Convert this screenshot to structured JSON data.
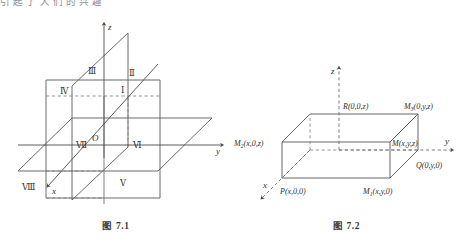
{
  "page": {
    "top_clipped_text": "引 起 了 人 们 的 兴 趣"
  },
  "figures": [
    {
      "id": "fig-7-1",
      "caption": "图 7.1",
      "axes": [
        {
          "name": "z-axis-label",
          "label": "z"
        },
        {
          "name": "y-axis-label",
          "label": "y"
        },
        {
          "name": "x-axis-label",
          "label": "x"
        }
      ],
      "origin_label": "O",
      "octants": [
        {
          "name": "octant-1",
          "label": "Ⅰ"
        },
        {
          "name": "octant-2",
          "label": "Ⅱ"
        },
        {
          "name": "octant-3",
          "label": "Ⅲ"
        },
        {
          "name": "octant-4",
          "label": "Ⅳ"
        },
        {
          "name": "octant-5",
          "label": "Ⅴ"
        },
        {
          "name": "octant-6",
          "label": "Ⅵ"
        },
        {
          "name": "octant-7",
          "label": "Ⅶ"
        },
        {
          "name": "octant-8",
          "label": "Ⅷ"
        }
      ]
    },
    {
      "id": "fig-7-2",
      "caption": "图 7.2",
      "axes": [
        {
          "name": "z-axis-label",
          "label": "z"
        },
        {
          "name": "y-axis-label",
          "label": "y"
        },
        {
          "name": "x-axis-label",
          "label": "x"
        }
      ],
      "points": [
        {
          "name": "point-R",
          "base": "R",
          "sub": "",
          "coords": "(0,0,z)"
        },
        {
          "name": "point-M3",
          "base": "M",
          "sub": "3",
          "coords": "(0,y,z)"
        },
        {
          "name": "point-M2",
          "base": "M",
          "sub": "2",
          "coords": "(x,0,z)"
        },
        {
          "name": "point-M",
          "base": "M",
          "sub": "",
          "coords": "(x,y,z)"
        },
        {
          "name": "point-Q",
          "base": "Q",
          "sub": "",
          "coords": "(0,y,0)"
        },
        {
          "name": "point-P",
          "base": "P",
          "sub": "",
          "coords": "(x,0,0)"
        },
        {
          "name": "point-M1",
          "base": "M",
          "sub": "1",
          "coords": "(x,y,0)"
        }
      ]
    }
  ],
  "colors": {
    "ink": "#2f2f2f",
    "line": "#555555",
    "dashed": "#777777",
    "background": "#ffffff"
  }
}
